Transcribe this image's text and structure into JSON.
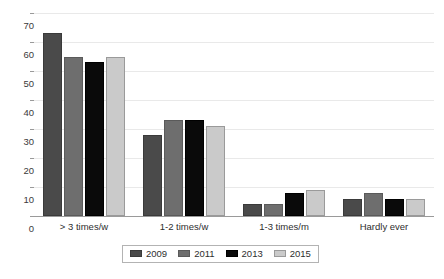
{
  "chart_data": {
    "type": "bar",
    "title": "",
    "subtitle": "",
    "xlabel": "",
    "ylabel": "",
    "ylim": [
      0,
      70
    ],
    "yticks": [
      0,
      10,
      20,
      30,
      40,
      50,
      60,
      70
    ],
    "ytick_labels": [
      "0",
      "10",
      "20",
      "30",
      "40",
      "50",
      "60",
      "70"
    ],
    "grid": true,
    "legend_position": "bottom",
    "categories": [
      "> 3 times/w",
      "1-2 times/w",
      "1-3 times/m",
      "Hardly ever"
    ],
    "series": [
      {
        "name": "2009",
        "color": "#4a4a4a",
        "values": [
          63,
          28,
          4,
          6
        ]
      },
      {
        "name": "2011",
        "color": "#6e6e6e",
        "values": [
          55,
          33,
          4,
          8
        ]
      },
      {
        "name": "2013",
        "color": "#0a0a0a",
        "values": [
          53,
          33,
          8,
          6
        ]
      },
      {
        "name": "2015",
        "color": "#cacaca",
        "values": [
          55,
          31,
          9,
          6
        ]
      }
    ]
  },
  "legend": {
    "entries": [
      {
        "label": "2009"
      },
      {
        "label": "2011"
      },
      {
        "label": "2013"
      },
      {
        "label": "2015"
      }
    ]
  },
  "colors": {
    "background": "#ffffff",
    "gridline": "#e9e9e9",
    "axis": "#9a9a9a",
    "text": "#2e2e2e",
    "series_2009": "#4a4a4a",
    "series_2011": "#6e6e6e",
    "series_2013": "#0a0a0a",
    "series_2015": "#cacaca"
  }
}
